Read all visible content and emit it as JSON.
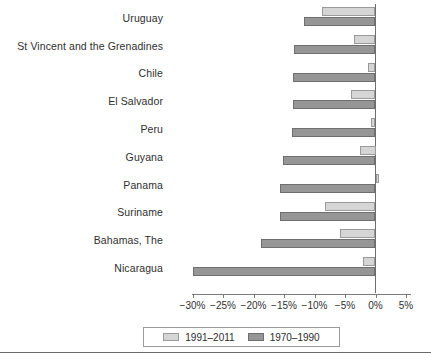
{
  "chart_data": {
    "type": "bar",
    "orientation": "horizontal",
    "title": "",
    "subtitle": "",
    "xlabel": "",
    "ylabel": "",
    "xlim": [
      -32.5,
      6.5
    ],
    "xticks": [
      -30,
      -25,
      -20,
      -15,
      -10,
      -5,
      0,
      5
    ],
    "xtick_labels": [
      "−30%",
      "−25%",
      "−20%",
      "−15%",
      "−10%",
      "−5%",
      "0%",
      "5%"
    ],
    "grid": false,
    "legend_position": "bottom",
    "categories": [
      "Uruguay",
      "St Vincent and the Grenadines",
      "Chile",
      "El Salvador",
      "Peru",
      "Guyana",
      "Panama",
      "Suriname",
      "Bahamas, The",
      "Nicaragua"
    ],
    "series": [
      {
        "name": "1991–2011",
        "color": "#d5d5d5",
        "values": [
          -8.7,
          -3.6,
          -1.2,
          -4.0,
          -0.8,
          -2.5,
          0.5,
          -8.2,
          -5.8,
          -2.0
        ]
      },
      {
        "name": "1970–1990",
        "color": "#969696",
        "values": [
          -11.8,
          -13.3,
          -13.6,
          -13.5,
          -13.7,
          -15.1,
          -15.6,
          -15.6,
          -18.7,
          -29.9
        ]
      }
    ]
  },
  "legend": {
    "entries": [
      {
        "label": "1991–2011"
      },
      {
        "label": "1970–1990"
      }
    ]
  }
}
